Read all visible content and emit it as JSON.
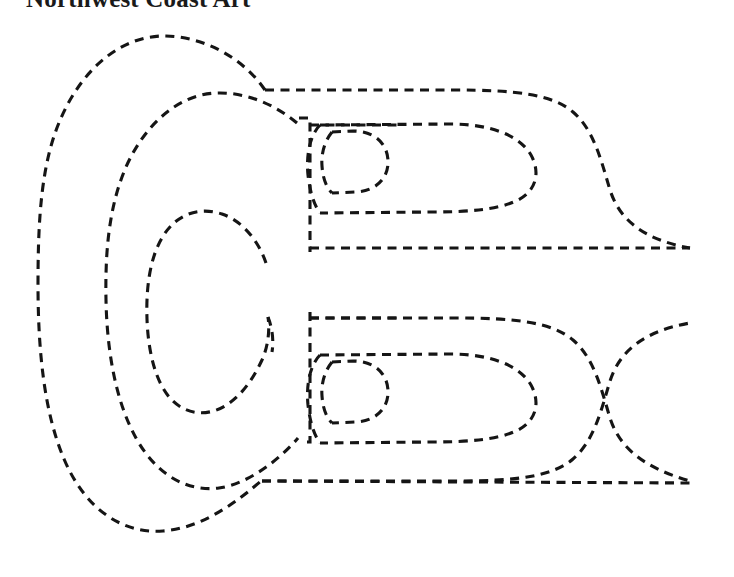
{
  "page": {
    "title": "Northwest Coast Art",
    "background_color": "#ffffff",
    "width": 734,
    "height": 577
  },
  "artwork": {
    "name": "northwest-coast-formline-ovoid-diagram",
    "description": "Dashed-outline Northwest Coast formline design: concentric ovoids at left with paired eye forms and tapering terminals at right",
    "style": {
      "stroke_color": "#151515",
      "stroke_width": 3,
      "dash_pattern": "9 6.5",
      "fill": "none"
    },
    "elements": [
      {
        "name": "outer-ovoid",
        "type": "closed-curve"
      },
      {
        "name": "middle-ovoid",
        "type": "closed-curve"
      },
      {
        "name": "inner-ovoid",
        "type": "closed-curve"
      },
      {
        "name": "upper-wing-outline",
        "type": "open-curve"
      },
      {
        "name": "upper-eye-outer",
        "type": "closed-curve"
      },
      {
        "name": "upper-eye-inner",
        "type": "closed-curve"
      },
      {
        "name": "upper-terminal-line",
        "type": "line"
      },
      {
        "name": "lower-wing-outline",
        "type": "open-curve"
      },
      {
        "name": "lower-eye-outer",
        "type": "closed-curve"
      },
      {
        "name": "lower-eye-inner",
        "type": "closed-curve"
      },
      {
        "name": "lower-terminal-line",
        "type": "line"
      },
      {
        "name": "central-vertical-divider",
        "type": "line"
      }
    ]
  }
}
